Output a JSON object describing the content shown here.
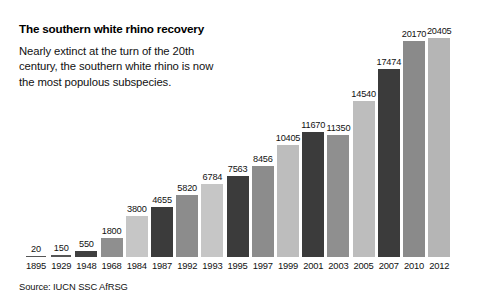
{
  "chart_data": {
    "type": "bar",
    "title": "The southern white rhino recovery",
    "subtitle": "Nearly extinct at the turn of the 20th century, the southern white rhino is now the most populous subspecies.",
    "source": "Source: IUCN SSC AfRSG",
    "xlabel": "",
    "ylabel": "",
    "ylim": [
      0,
      20405
    ],
    "grid": false,
    "legend": false,
    "categories": [
      "1895",
      "1929",
      "1948",
      "1968",
      "1984",
      "1987",
      "1992",
      "1993",
      "1995",
      "1997",
      "1999",
      "2001",
      "2003",
      "2005",
      "2007",
      "2010",
      "2012"
    ],
    "values": [
      20,
      150,
      550,
      1800,
      3800,
      4655,
      5820,
      6784,
      7563,
      8456,
      10405,
      11670,
      11350,
      14540,
      17474,
      20170,
      20405
    ],
    "value_labels": [
      "20",
      "150",
      "550",
      "1800",
      "3800",
      "4655",
      "5820",
      "6784",
      "7563",
      "8456",
      "10405",
      "11670",
      "11350",
      "14540",
      "17474",
      "20170",
      "20405"
    ],
    "bar_colors": [
      "#555555",
      "#555555",
      "#3f3f3f",
      "#8f8f8f",
      "#c6c6c6",
      "#3b3b3b",
      "#8c8c8c",
      "#c6c6c6",
      "#3b3b3b",
      "#8c8c8c",
      "#bdbdbd",
      "#3b3b3b",
      "#8f8f8f",
      "#bdbdbd",
      "#3b3b3b",
      "#8a8a8a",
      "#b5b5b5"
    ]
  },
  "palette": {
    "background": "#ffffff",
    "text": "#111111",
    "light_gray": "#c6c6c6",
    "medium_gray": "#8c8c8c",
    "dark_gray": "#3b3b3b"
  }
}
